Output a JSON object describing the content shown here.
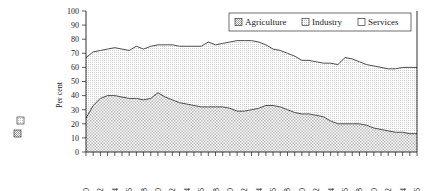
{
  "figure": {
    "orphan_swatches": [
      {
        "name": "orphan-swatch-upper",
        "pattern": "industry-hatch"
      },
      {
        "name": "orphan-swatch-lower",
        "pattern": "agriculture-hatch"
      }
    ]
  },
  "chart_data": {
    "type": "area",
    "title": "",
    "subtitle": "",
    "xlabel": "",
    "ylabel": "Per cent",
    "stacked": true,
    "grid": false,
    "legend_position": "top-right",
    "ylim": [
      0,
      100
    ],
    "yticks": [
      0,
      10,
      20,
      30,
      40,
      50,
      60,
      70,
      80,
      90,
      100
    ],
    "xlim": [
      1960,
      2006
    ],
    "xticks": [
      1960,
      1962,
      1964,
      1966,
      1968,
      1970,
      1972,
      1974,
      1976,
      1978,
      1980,
      1982,
      1984,
      1986,
      1988,
      1990,
      1992,
      1994,
      1996,
      1998,
      2000,
      2002,
      2004,
      2006
    ],
    "xtick_labels": [
      "1960",
      "1962",
      "1964",
      "1966",
      "1968",
      "1970",
      "1972",
      "1974",
      "1976",
      "1978",
      "1980",
      "1982",
      "1984",
      "1986",
      "1988",
      "1990",
      "1992",
      "1994",
      "1996",
      "1998",
      "2000",
      "2002",
      "2004",
      "2006"
    ],
    "x": [
      1960,
      1961,
      1962,
      1963,
      1964,
      1965,
      1966,
      1967,
      1968,
      1969,
      1970,
      1971,
      1972,
      1973,
      1974,
      1975,
      1976,
      1977,
      1978,
      1979,
      1980,
      1981,
      1982,
      1983,
      1984,
      1985,
      1986,
      1987,
      1988,
      1989,
      1990,
      1991,
      1992,
      1993,
      1994,
      1995,
      1996,
      1997,
      1998,
      1999,
      2000,
      2001,
      2002,
      2003,
      2004,
      2005,
      2006
    ],
    "series": [
      {
        "name": "Agriculture",
        "pattern": "agriculture-hatch",
        "values": [
          24,
          33,
          38,
          40,
          40,
          39,
          38,
          38,
          37,
          38,
          42,
          39,
          37,
          35,
          34,
          33,
          32,
          32,
          32,
          32,
          31,
          29,
          29,
          30,
          31,
          33,
          33,
          32,
          30,
          28,
          27,
          27,
          26,
          25,
          22,
          20,
          20,
          20,
          20,
          19,
          17,
          16,
          15,
          14,
          14,
          13,
          13
        ]
      },
      {
        "name": "Industry",
        "pattern": "industry-hatch",
        "values": [
          43,
          38,
          34,
          33,
          34,
          34,
          34,
          37,
          36,
          37,
          34,
          37,
          39,
          40,
          41,
          42,
          43,
          46,
          44,
          45,
          47,
          50,
          50,
          49,
          47,
          43,
          40,
          40,
          40,
          40,
          38,
          38,
          38,
          38,
          41,
          42,
          47,
          46,
          44,
          43,
          44,
          44,
          44,
          45,
          46,
          47,
          47
        ]
      },
      {
        "name": "Services",
        "pattern": "none",
        "values": [
          33,
          29,
          28,
          27,
          26,
          27,
          28,
          25,
          27,
          25,
          24,
          24,
          24,
          25,
          25,
          25,
          25,
          22,
          24,
          23,
          22,
          21,
          21,
          21,
          22,
          24,
          27,
          28,
          30,
          32,
          35,
          35,
          36,
          37,
          37,
          38,
          33,
          34,
          36,
          38,
          39,
          40,
          41,
          41,
          40,
          40,
          40
        ]
      }
    ],
    "cumulative_agriculture_top": [
      24,
      33,
      38,
      40,
      40,
      39,
      38,
      38,
      37,
      38,
      42,
      39,
      37,
      35,
      34,
      33,
      32,
      32,
      32,
      32,
      31,
      29,
      29,
      30,
      31,
      33,
      33,
      32,
      30,
      28,
      27,
      27,
      26,
      25,
      22,
      20,
      20,
      20,
      20,
      19,
      17,
      16,
      15,
      14,
      14,
      13,
      13
    ],
    "cumulative_industry_top": [
      67,
      71,
      72,
      73,
      74,
      73,
      72,
      75,
      73,
      75,
      76,
      76,
      76,
      75,
      75,
      75,
      75,
      78,
      76,
      77,
      78,
      79,
      79,
      79,
      78,
      76,
      73,
      72,
      70,
      68,
      65,
      65,
      64,
      63,
      63,
      62,
      67,
      66,
      64,
      62,
      61,
      60,
      59,
      59,
      60,
      60,
      60
    ],
    "legend": [
      {
        "label": "Agriculture",
        "pattern": "agriculture-hatch"
      },
      {
        "label": "Industry",
        "pattern": "industry-hatch"
      },
      {
        "label": "Services",
        "pattern": "none"
      }
    ]
  }
}
